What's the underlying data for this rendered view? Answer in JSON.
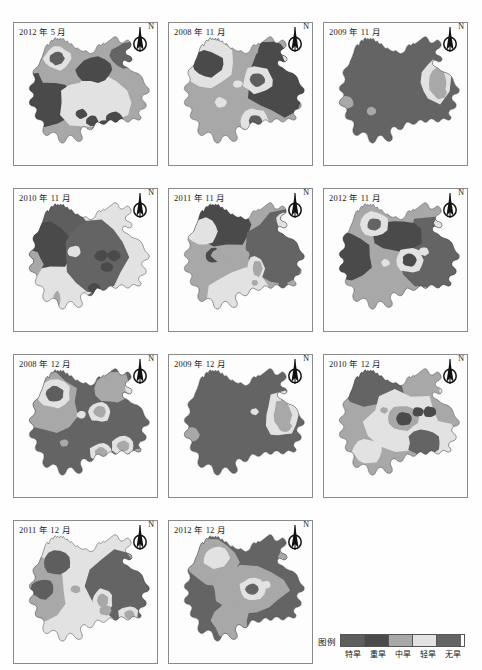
{
  "figure": {
    "width": 482,
    "height": 670,
    "background": "#ffffff",
    "region_name": "Yunnan Province",
    "grid": {
      "columns": 3,
      "rows": 4,
      "panel_count": 11
    }
  },
  "north_arrow": {
    "label": "N",
    "icon": "north-arrow-compass-icon"
  },
  "panels": [
    {
      "id": "p1",
      "label": "2012 年 5 月",
      "row": 1,
      "col": 1,
      "x": 13,
      "y": 22,
      "w": 145,
      "h": 144,
      "dominant_class": "中旱",
      "pattern": "north-moderate-with-extreme-core, southwest-severe, center-light"
    },
    {
      "id": "p2",
      "label": "2008 年 11 月",
      "row": 1,
      "col": 2,
      "x": 168,
      "y": 22,
      "w": 145,
      "h": 144,
      "dominant_class": "中旱",
      "pattern": "northwest-light-with-severe-core, east-severe, two-extreme-cores"
    },
    {
      "id": "p3",
      "label": "2009 年 11 月",
      "row": 1,
      "col": 3,
      "x": 323,
      "y": 22,
      "w": 145,
      "h": 144,
      "dominant_class": "无旱",
      "pattern": "province-wide-no-drought, small-east-light-band"
    },
    {
      "id": "p4",
      "label": "2010 年 11 月",
      "row": 2,
      "col": 1,
      "x": 13,
      "y": 188,
      "w": 145,
      "h": 144,
      "dominant_class": "轻旱",
      "pattern": "north-extreme, west-severe, east-light-with-spots"
    },
    {
      "id": "p5",
      "label": "2011 年 11 月",
      "row": 2,
      "col": 2,
      "x": 168,
      "y": 188,
      "w": 145,
      "h": 144,
      "dominant_class": "中旱",
      "pattern": "north-severe, east-no-drought, southwest-light"
    },
    {
      "id": "p6",
      "label": "2012 年 11 月",
      "row": 2,
      "col": 3,
      "x": 323,
      "y": 188,
      "w": 145,
      "h": 144,
      "dominant_class": "中旱",
      "pattern": "east-no-drought, west-severe, center-light-cores"
    },
    {
      "id": "p7",
      "label": "2008 年 12 月",
      "row": 3,
      "col": 1,
      "x": 13,
      "y": 354,
      "w": 145,
      "h": 144,
      "dominant_class": "无旱",
      "pattern": "southern-no-drought, northwest-extreme-core, scattered-light-rings"
    },
    {
      "id": "p8",
      "label": "2009 年 12 月",
      "row": 3,
      "col": 2,
      "x": 168,
      "y": 354,
      "w": 145,
      "h": 144,
      "dominant_class": "无旱",
      "pattern": "province-wide-no-drought, east-light-band"
    },
    {
      "id": "p9",
      "label": "2010 年 12 月",
      "row": 3,
      "col": 3,
      "x": 323,
      "y": 354,
      "w": 145,
      "h": 144,
      "dominant_class": "轻旱",
      "pattern": "north-no-drought, center-light, southeast-no-drought-core"
    },
    {
      "id": "p10",
      "label": "2011 年 12 月",
      "row": 4,
      "col": 1,
      "x": 13,
      "y": 520,
      "w": 145,
      "h": 144,
      "dominant_class": "轻旱",
      "pattern": "northwest-light-with-extreme-cores, east-no-drought"
    },
    {
      "id": "p11",
      "label": "2012 年 12 月",
      "row": 4,
      "col": 2,
      "x": 168,
      "y": 520,
      "w": 145,
      "h": 144,
      "dominant_class": "无旱",
      "pattern": "province-wide-no-drought, northwest-light-core, center-moderate-band"
    }
  ],
  "legend": {
    "title": "图例",
    "x": 318,
    "y": 634,
    "items": [
      {
        "label": "特旱",
        "color": "#5e5e5e",
        "rank": 1,
        "meaning_en": "extreme drought"
      },
      {
        "label": "重旱",
        "color": "#4a4a4a",
        "rank": 2,
        "meaning_en": "severe drought"
      },
      {
        "label": "中旱",
        "color": "#a8a8a8",
        "rank": 3,
        "meaning_en": "moderate drought"
      },
      {
        "label": "轻旱",
        "color": "#e2e2e2",
        "rank": 4,
        "meaning_en": "light drought"
      },
      {
        "label": "无旱",
        "color": "#646464",
        "rank": 5,
        "meaning_en": "no drought"
      }
    ]
  },
  "chart_data": {
    "type": "map",
    "title": "",
    "subtitle": "",
    "map_region": "Yunnan Province, China",
    "variable": "drought severity class",
    "classes": [
      "特旱",
      "重旱",
      "中旱",
      "轻旱",
      "无旱"
    ],
    "class_colors": [
      "#5e5e5e",
      "#4a4a4a",
      "#a8a8a8",
      "#e2e2e2",
      "#646464"
    ],
    "small_multiples": [
      {
        "panel": "2012 年 5 月",
        "dominant_class": "中旱"
      },
      {
        "panel": "2008 年 11 月",
        "dominant_class": "中旱"
      },
      {
        "panel": "2009 年 11 月",
        "dominant_class": "无旱"
      },
      {
        "panel": "2010 年 11 月",
        "dominant_class": "轻旱"
      },
      {
        "panel": "2011 年 11 月",
        "dominant_class": "中旱"
      },
      {
        "panel": "2012 年 11 月",
        "dominant_class": "中旱"
      },
      {
        "panel": "2008 年 12 月",
        "dominant_class": "无旱"
      },
      {
        "panel": "2009 年 12 月",
        "dominant_class": "无旱"
      },
      {
        "panel": "2010 年 12 月",
        "dominant_class": "轻旱"
      },
      {
        "panel": "2011 年 12 月",
        "dominant_class": "轻旱"
      },
      {
        "panel": "2012 年 12 月",
        "dominant_class": "无旱"
      }
    ],
    "legend_position": "bottom-right",
    "grid": false,
    "xlabel": "",
    "ylabel": ""
  }
}
